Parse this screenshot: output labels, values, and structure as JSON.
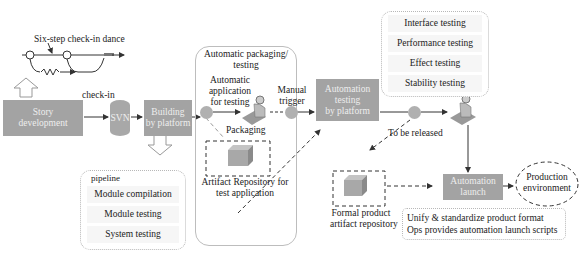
{
  "six_step": {
    "label": "Six-step check-in dance"
  },
  "nodes": {
    "story": {
      "line1": "Story",
      "line2": "development"
    },
    "checkin": "check-in",
    "svn": "SVN",
    "building": {
      "line1": "Building",
      "line2": "by platform"
    },
    "auto_testing": {
      "line1": "Automation",
      "line2": "testing",
      "line3": "by platform"
    },
    "auto_launch": {
      "line1": "Automation",
      "line2": "launch"
    },
    "production": {
      "line1": "Production",
      "line2": "environment"
    }
  },
  "pipeline": {
    "title": "pipeline",
    "items": [
      "Module compilation",
      "Module testing",
      "System testing"
    ]
  },
  "packaging_group": {
    "title_line1": "Automatic packaging/",
    "title_line2": "testing",
    "auto_app_line1": "Automatic",
    "auto_app_line2": "application",
    "auto_app_line3": "for testing",
    "packaging": "Packaging",
    "repo_line1": "Artifact Repository for",
    "repo_line2": "test application"
  },
  "manual_trigger": {
    "line1": "Manual",
    "line2": "trigger"
  },
  "testing_types": [
    "Interface testing",
    "Performance testing",
    "Effect testing",
    "Stability testing"
  ],
  "to_be_released": "To be released",
  "formal_repo": {
    "line1": "Formal product",
    "line2": "artifact repository"
  },
  "notes": {
    "line1": "Unify & standardize product format",
    "line2": "Ops provides automation launch scripts"
  }
}
